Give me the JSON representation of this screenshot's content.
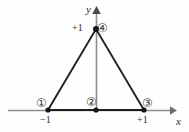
{
  "figure": {
    "type": "geometry-diagram",
    "title": "",
    "background_color": "#fefefe",
    "width": 189,
    "height": 132
  },
  "axes": {
    "x": {
      "label": "x",
      "color": "#8a8a8a",
      "y_pixel": 110,
      "start_x": 8,
      "end_x": 173,
      "arrow": "right"
    },
    "y": {
      "label": "y",
      "color": "#8a8a8a",
      "x_pixel": 96,
      "start_y": 110,
      "end_y": 10,
      "arrow": "up"
    }
  },
  "tick_labels": [
    {
      "text": "+1",
      "axis": "y",
      "value": 1,
      "x": 72,
      "y": 23
    },
    {
      "text": "−1",
      "axis": "x",
      "value": -1,
      "x": 40,
      "y": 115
    },
    {
      "text": "+1",
      "axis": "x",
      "value": 1,
      "x": 137,
      "y": 115
    }
  ],
  "shape": {
    "name": "triangle",
    "stroke_color": "#231f20",
    "vertices": [
      {
        "id": 1,
        "x": -1,
        "y": 0,
        "px": 48,
        "py": 110
      },
      {
        "id": 4,
        "x": 0,
        "y": 1,
        "px": 96,
        "py": 29
      },
      {
        "id": 3,
        "x": 1,
        "y": 0,
        "px": 144,
        "py": 110
      }
    ]
  },
  "nodes": [
    {
      "id": "1",
      "badge": "①",
      "px": 48,
      "py": 110,
      "badge_x": 37,
      "badge_y": 98
    },
    {
      "id": "2",
      "badge": "②",
      "px": 96,
      "py": 110,
      "badge_x": 87,
      "badge_y": 97
    },
    {
      "id": "3",
      "badge": "③",
      "px": 144,
      "py": 110,
      "badge_x": 143,
      "badge_y": 98
    },
    {
      "id": "4",
      "badge": "④",
      "px": 96,
      "py": 29,
      "badge_x": 98,
      "badge_y": 23
    }
  ],
  "node_dot": {
    "color": "#1a1a1a",
    "radius": 2.6
  }
}
